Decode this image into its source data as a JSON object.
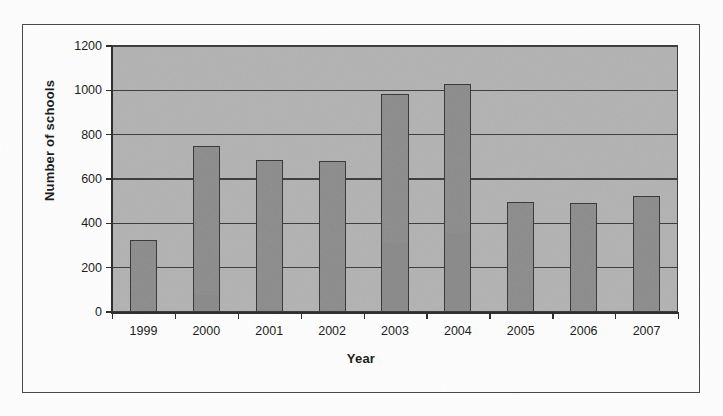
{
  "chart_data": {
    "type": "bar",
    "title": "",
    "xlabel": "Year",
    "ylabel": "Number of schools",
    "categories": [
      "1999",
      "2000",
      "2001",
      "2002",
      "2003",
      "2004",
      "2005",
      "2006",
      "2007"
    ],
    "values": [
      325,
      750,
      685,
      680,
      985,
      1030,
      495,
      490,
      525
    ],
    "series": [
      {
        "name": "Number of schools",
        "values": [
          325,
          750,
          685,
          680,
          985,
          1030,
          495,
          490,
          525
        ]
      }
    ],
    "ylim": [
      0,
      1200
    ],
    "ytick_step": 200,
    "yticks": [
      0,
      200,
      400,
      600,
      800,
      1000,
      1200
    ],
    "ytick_labels": [
      "0",
      "200",
      "400",
      "600",
      "800",
      "1000",
      "1200"
    ],
    "grid": true,
    "grid_axis": "y",
    "legend": false,
    "legend_position": "none",
    "bar_color": "#8b8b8b",
    "bar_edge_color": "#3a3a3a",
    "plot_background_color": "#b2b2b2",
    "axis_color": "#2f2f2f",
    "frame_color": "#4a4a4a"
  }
}
